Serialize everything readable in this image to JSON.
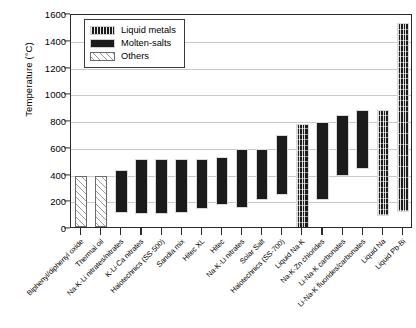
{
  "chart_data": {
    "type": "bar",
    "subtype": "floating-range-bar",
    "title": "",
    "xlabel": "",
    "ylabel": "Temperature (°C)",
    "ylim": [
      0,
      1600
    ],
    "yticks": [
      0,
      200,
      400,
      600,
      800,
      1000,
      1200,
      1400,
      1600
    ],
    "grid": true,
    "legend_position": "upper-left",
    "legend": [
      {
        "label": "Liquid metals",
        "pattern": "vertical-cross-hatch",
        "color": "#1b1b1b"
      },
      {
        "label": "Molten-salts",
        "pattern": "solid",
        "color": "#1b1b1b"
      },
      {
        "label": "Others",
        "pattern": "diagonal-hatch",
        "color": "#ececec"
      }
    ],
    "categories": [
      "Biphenyl/diphenyl oxide",
      "Thermal oil",
      "Na-K-Li nitrates/nitrates",
      "K-Li-Ca nitrates",
      "Halotechnics (SS-500)",
      "Sandia mix",
      "Hitec XL",
      "Hitec",
      "Na-K-Li nitrates",
      "Solar Salt",
      "Halotechnics (SS-700)",
      "Liquid Na-K",
      "Na-K-Zn chlorides",
      "Li-Na-K carbonates",
      "Li-Na-K fluorides/carbonates",
      "Liquid Na",
      "Liquid Pb-Bi"
    ],
    "series": [
      {
        "name": "Operating temperature range",
        "units": "°C",
        "bars": [
          {
            "category": "Biphenyl/diphenyl oxide",
            "group": "Others",
            "low": 15,
            "high": 400
          },
          {
            "category": "Thermal oil",
            "group": "Others",
            "low": 15,
            "high": 395
          },
          {
            "category": "Na-K-Li nitrates/nitrates",
            "group": "Molten-salts",
            "low": 120,
            "high": 440
          },
          {
            "category": "K-Li-Ca nitrates",
            "group": "Molten-salts",
            "low": 110,
            "high": 520
          },
          {
            "category": "Halotechnics (SS-500)",
            "group": "Molten-salts",
            "low": 110,
            "high": 525
          },
          {
            "category": "Sandia mix",
            "group": "Molten-salts",
            "low": 120,
            "high": 525
          },
          {
            "category": "Hitec XL",
            "group": "Molten-salts",
            "low": 150,
            "high": 520
          },
          {
            "category": "Hitec",
            "group": "Molten-salts",
            "low": 180,
            "high": 535
          },
          {
            "category": "Na-K-Li nitrates",
            "group": "Molten-salts",
            "low": 160,
            "high": 595
          },
          {
            "category": "Solar Salt",
            "group": "Molten-salts",
            "low": 220,
            "high": 595
          },
          {
            "category": "Halotechnics (SS-700)",
            "group": "Molten-salts",
            "low": 255,
            "high": 700
          },
          {
            "category": "Liquid Na-K",
            "group": "Liquid metals",
            "low": 0,
            "high": 785
          },
          {
            "category": "Na-K-Zn chlorides",
            "group": "Molten-salts",
            "low": 215,
            "high": 800
          },
          {
            "category": "Li-Na-K carbonates",
            "group": "Molten-salts",
            "low": 400,
            "high": 850
          },
          {
            "category": "Li-Na-K fluorides/carbonates",
            "group": "Molten-salts",
            "low": 450,
            "high": 890
          },
          {
            "category": "Liquid Na",
            "group": "Liquid metals",
            "low": 100,
            "high": 890
          },
          {
            "category": "Liquid Pb-Bi",
            "group": "Liquid metals",
            "low": 125,
            "high": 1540
          }
        ]
      }
    ]
  }
}
